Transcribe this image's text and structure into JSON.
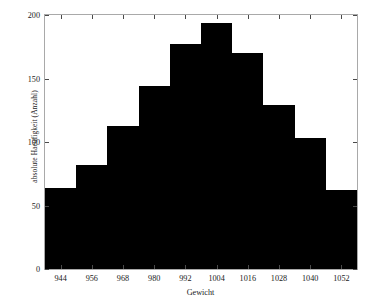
{
  "chart_data": {
    "type": "bar",
    "title": "",
    "xlabel": "Gewicht",
    "ylabel": "absolute Haeufigkeit (Anzahl)",
    "grid": false,
    "legend": false,
    "bin_width": 12,
    "xlim": [
      938,
      1058
    ],
    "ylim": [
      0,
      200
    ],
    "xticks": [
      944,
      956,
      968,
      980,
      992,
      1004,
      1016,
      1028,
      1040,
      1052
    ],
    "yticks": [
      0,
      50,
      100,
      150,
      200
    ],
    "bin_edges": [
      938,
      950,
      962,
      974,
      986,
      998,
      1010,
      1022,
      1034,
      1046,
      1058
    ],
    "bin_centers": [
      944,
      956,
      968,
      980,
      992,
      1004,
      1016,
      1028,
      1040,
      1052
    ],
    "categories": [
      "944",
      "956",
      "968",
      "980",
      "992",
      "1004",
      "1016",
      "1028",
      "1040",
      "1052"
    ],
    "values": [
      64,
      82,
      113,
      144,
      177,
      194,
      170,
      129,
      103,
      62
    ],
    "bar_color": "#000000",
    "axis_color": "#a9a9a9"
  }
}
